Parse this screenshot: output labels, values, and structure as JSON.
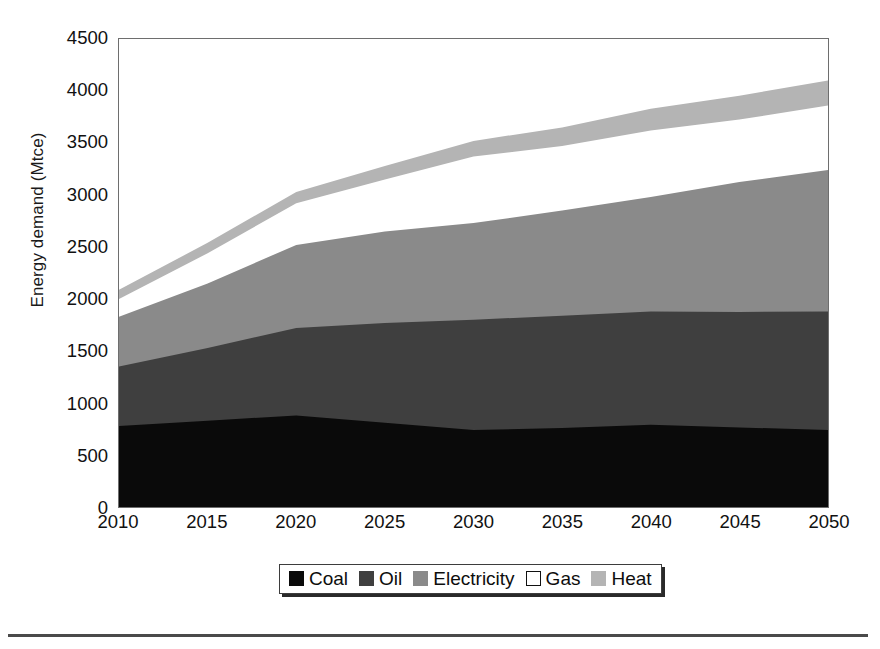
{
  "chart_data": {
    "type": "area",
    "stacked": true,
    "title": "",
    "subtitle": "",
    "xlabel": "",
    "ylabel": "Energy demand (Mtce)",
    "x": [
      2010,
      2015,
      2020,
      2025,
      2030,
      2035,
      2040,
      2045,
      2050
    ],
    "categories": [
      "2010",
      "2015",
      "2020",
      "2025",
      "2030",
      "2035",
      "2040",
      "2045",
      "2050"
    ],
    "xlim": [
      2010,
      2050
    ],
    "ylim": [
      0,
      4500
    ],
    "ytick_labels": [
      "0",
      "500",
      "1000",
      "1500",
      "2000",
      "2500",
      "3000",
      "3500",
      "4000",
      "4500"
    ],
    "ytick_values": [
      0,
      500,
      1000,
      1500,
      2000,
      2500,
      3000,
      3500,
      4000,
      4500
    ],
    "xtick_labels": [
      "2010",
      "2015",
      "2020",
      "2025",
      "2030",
      "2035",
      "2040",
      "2045",
      "2050"
    ],
    "grid": false,
    "legend_position": "bottom-center",
    "series": [
      {
        "name": "Coal",
        "color": "#0a0a0a",
        "values": [
          780,
          830,
          880,
          810,
          740,
          760,
          790,
          765,
          740
        ]
      },
      {
        "name": "Oil",
        "color": "#3f3f3f",
        "values": [
          570,
          700,
          840,
          960,
          1060,
          1080,
          1090,
          1110,
          1140
        ]
      },
      {
        "name": "Electricity",
        "color": "#8a8a8a",
        "values": [
          480,
          620,
          800,
          880,
          930,
          1010,
          1100,
          1250,
          1360
        ]
      },
      {
        "name": "Gas",
        "color": "#ffffff",
        "values": [
          170,
          290,
          400,
          500,
          640,
          620,
          640,
          600,
          620
        ]
      },
      {
        "name": "Heat",
        "color": "#b4b4b4",
        "values": [
          90,
          100,
          110,
          130,
          150,
          180,
          210,
          230,
          240
        ]
      }
    ],
    "cumulative_tops": {
      "Coal": [
        780,
        830,
        880,
        810,
        740,
        760,
        790,
        765,
        740
      ],
      "Oil": [
        1350,
        1530,
        1720,
        1770,
        1800,
        1840,
        1880,
        1875,
        1880
      ],
      "Electricity": [
        1830,
        2150,
        2520,
        2650,
        2730,
        2850,
        2980,
        3125,
        3240
      ],
      "Gas": [
        2000,
        2440,
        2920,
        3150,
        3370,
        3470,
        3620,
        3725,
        3860
      ],
      "Heat": [
        2090,
        2540,
        3030,
        3280,
        3520,
        3650,
        3830,
        3955,
        4100
      ]
    },
    "legend": [
      {
        "label": "Coal",
        "swatch": "#0a0a0a",
        "border": "#0a0a0a"
      },
      {
        "label": "Oil",
        "swatch": "#3f3f3f",
        "border": "#3f3f3f"
      },
      {
        "label": "Electricity",
        "swatch": "#8a8a8a",
        "border": "#8a8a8a"
      },
      {
        "label": "Gas",
        "swatch": "#ffffff",
        "border": "#111111"
      },
      {
        "label": "Heat",
        "swatch": "#b4b4b4",
        "border": "#b4b4b4"
      }
    ]
  },
  "colors": {
    "coal": "#0a0a0a",
    "oil": "#3f3f3f",
    "electricity": "#8a8a8a",
    "gas": "#ffffff",
    "heat": "#b4b4b4",
    "axis": "#6e6e6e",
    "text": "#111111",
    "rule": "#4a4a4a"
  }
}
